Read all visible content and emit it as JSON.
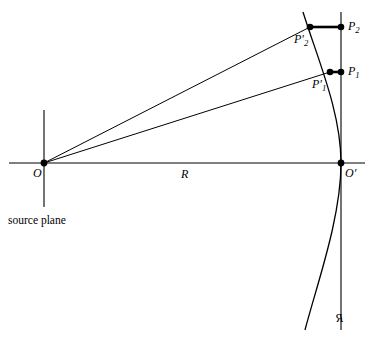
{
  "figure": {
    "kind": "geometric-optics-diagram",
    "width": 375,
    "height": 338,
    "background_color": "#ffffff",
    "stroke_color": "#000000"
  },
  "labels": {
    "origin": "O",
    "origin_prime": "O′",
    "distance": "R",
    "point_1": "P",
    "point_1_sub": "1",
    "point_2": "P",
    "point_2_sub": "2",
    "point_1_prime": "P",
    "point_1_prime_sub": "1",
    "point_1_prime_mark": "′",
    "point_2_prime": "P",
    "point_2_prime_sub": "2",
    "point_2_prime_mark": "′",
    "source_plane": "source plane",
    "reference_sphere": "\u0000R"
  },
  "geometry": {
    "origin": {
      "x": 44,
      "y": 163
    },
    "origin_prime": {
      "x": 341,
      "y": 163
    },
    "axis": {
      "x1": 9,
      "y1": 163,
      "x2": 365,
      "y2": 163
    },
    "source_plane_line": {
      "x": 44,
      "y1": 110,
      "y2": 207
    },
    "observer_plane_line": {
      "x": 341,
      "y1": 12,
      "y2": 330
    },
    "arc": {
      "top_x": 303,
      "top_y": 12,
      "apex_x": 341,
      "apex_y": 163,
      "bottom_x": 305,
      "bottom_y": 330
    },
    "p1_prime": {
      "x": 330,
      "y": 72
    },
    "p1": {
      "x": 341,
      "y": 72
    },
    "p2_prime": {
      "x": 310,
      "y": 27
    },
    "p2": {
      "x": 341,
      "y": 27
    },
    "dot_radius": 3.2,
    "thin_stroke_width": 1.0,
    "thick_stroke_width": 2.6
  }
}
